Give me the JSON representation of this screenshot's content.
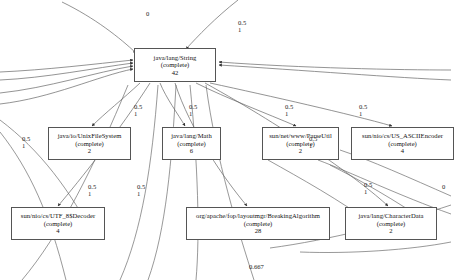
{
  "diagram": {
    "type": "directed-weighted-call-graph",
    "background": "#ffffff",
    "node_border_color": "#555555",
    "edge_color": "#666666",
    "state_label": "(complete)",
    "nodes": [
      {
        "id": "string",
        "name": "java/lang/String",
        "state": "(complete)",
        "count": "42",
        "x": 134,
        "y": 48,
        "w": 82,
        "h": 34
      },
      {
        "id": "unixfs",
        "name": "java/io/UnixFileSystem",
        "state": "(complete)",
        "count": "2",
        "x": 48,
        "y": 127,
        "w": 83,
        "h": 33
      },
      {
        "id": "math",
        "name": "java/lang/Math",
        "state": "(complete)",
        "count": "6",
        "x": 162,
        "y": 127,
        "w": 59,
        "h": 33
      },
      {
        "id": "parseutil",
        "name": "sun/net/www/ParseUtil",
        "state": "(complete)",
        "count": "2",
        "x": 262,
        "y": 127,
        "w": 77,
        "h": 33
      },
      {
        "id": "usascii",
        "name": "sun/nio/cs/US_ASCIIEncoder",
        "state": "(complete)",
        "count": "4",
        "x": 351,
        "y": 127,
        "w": 103,
        "h": 33
      },
      {
        "id": "utf8decoder",
        "name": "sun/nio/cs/UTF_8$Decoder",
        "state": "(complete)",
        "count": "4",
        "x": 11,
        "y": 207,
        "w": 94,
        "h": 33
      },
      {
        "id": "breakingalgo",
        "name": "org/apache/fop/layoutmgr/BreakingAlgorithm",
        "state": "(complete)",
        "count": "28",
        "x": 186,
        "y": 207,
        "w": 144,
        "h": 33
      },
      {
        "id": "characterdata",
        "name": "java/lang/CharacterData",
        "state": "(complete)",
        "count": "2",
        "x": 345,
        "y": 207,
        "w": 92,
        "h": 33
      }
    ],
    "edge_labels": [
      {
        "id": "l-top-left",
        "top": "0",
        "bottom": "",
        "x": 146,
        "y": 11
      },
      {
        "id": "l-top-right",
        "top": "0.5",
        "bottom": "1",
        "x": 238,
        "y": 20
      },
      {
        "id": "l-mid-1",
        "top": "0.5",
        "bottom": "1",
        "x": 134,
        "y": 104
      },
      {
        "id": "l-mid-2",
        "top": "0.5",
        "bottom": "1",
        "x": 189,
        "y": 104
      },
      {
        "id": "l-mid-3",
        "top": "0.5",
        "bottom": "1",
        "x": 285,
        "y": 104
      },
      {
        "id": "l-mid-4",
        "top": "0.5",
        "bottom": "1",
        "x": 359,
        "y": 104
      },
      {
        "id": "l-left-edge",
        "top": "0.5",
        "bottom": "1",
        "x": 22,
        "y": 136
      },
      {
        "id": "l-right-edge",
        "top": "0.5",
        "bottom": "1",
        "x": 309,
        "y": 136
      },
      {
        "id": "l-low-1",
        "top": "0.5",
        "bottom": "1",
        "x": 88,
        "y": 184
      },
      {
        "id": "l-low-2",
        "top": "0.5",
        "bottom": "1",
        "x": 137,
        "y": 184
      },
      {
        "id": "l-low-3",
        "top": "0.5",
        "bottom": "1",
        "x": 364,
        "y": 182
      },
      {
        "id": "l-far-right",
        "top": "0",
        "bottom": "",
        "x": 442,
        "y": 184
      },
      {
        "id": "l-bottom",
        "top": "0.667",
        "bottom": "",
        "x": 249,
        "y": 264
      }
    ]
  }
}
